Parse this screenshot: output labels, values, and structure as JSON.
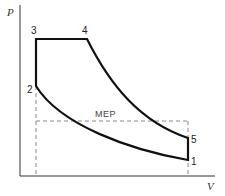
{
  "diagram": {
    "axes": {
      "y_label": "P",
      "x_label": "V"
    },
    "points": [
      {
        "id": "1",
        "label": "1",
        "x": 188,
        "y": 160
      },
      {
        "id": "2",
        "label": "2",
        "x": 36,
        "y": 86
      },
      {
        "id": "3",
        "label": "3",
        "x": 36,
        "y": 39
      },
      {
        "id": "4",
        "label": "4",
        "x": 87,
        "y": 39
      },
      {
        "id": "5",
        "label": "5",
        "x": 188,
        "y": 138
      }
    ],
    "mep_label": "MEP",
    "colors": {
      "cycle_line": "#111111",
      "axis": "#333333",
      "dashed": "#888888"
    }
  }
}
